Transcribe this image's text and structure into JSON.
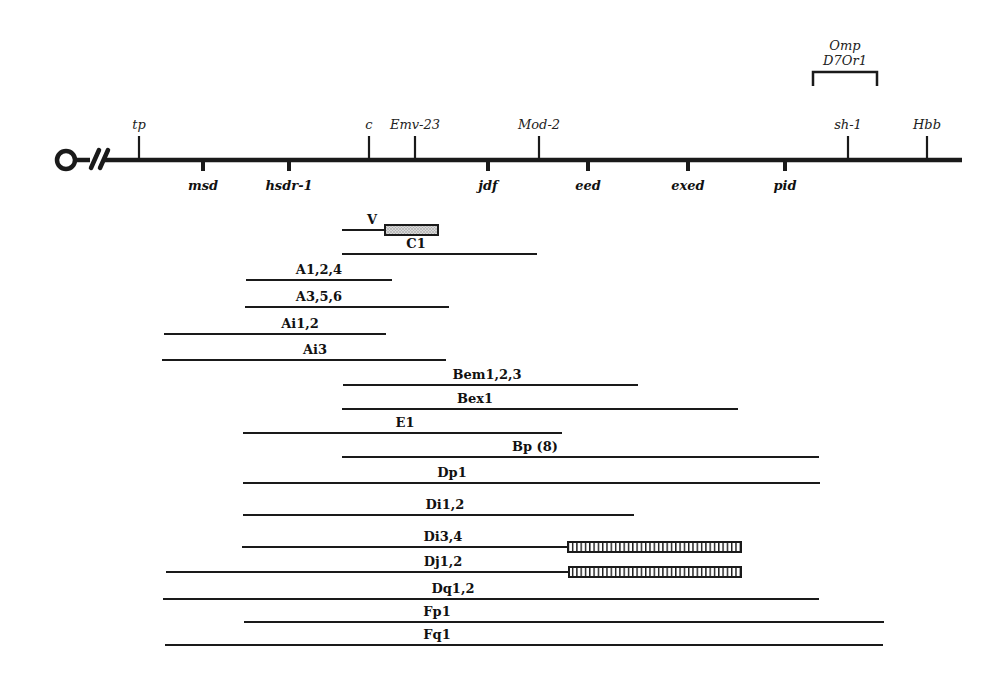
{
  "chromosome": {
    "centromere_symbol": "centromere-break",
    "axis": {
      "x_start": 105,
      "x_end": 962,
      "y": 160
    },
    "loci_above": [
      {
        "name": "tp",
        "x": 139
      },
      {
        "name": "c",
        "x": 369
      },
      {
        "name": "Emv-23",
        "x": 415
      },
      {
        "name": "Mod-2",
        "x": 539
      },
      {
        "name": "sh-1",
        "x": 848
      },
      {
        "name": "Hbb",
        "x": 927
      }
    ],
    "loci_below": [
      {
        "name": "msd",
        "x": 203
      },
      {
        "name": "hsdr-1",
        "x": 289
      },
      {
        "name": "jdf",
        "x": 488
      },
      {
        "name": "eed",
        "x": 588
      },
      {
        "name": "exed",
        "x": 688
      },
      {
        "name": "pid",
        "x": 785
      }
    ],
    "bracket": {
      "label_line1": "Omp",
      "label_line2": "D7Or1",
      "x_start": 813,
      "x_end": 877
    }
  },
  "deletions": [
    {
      "label": "V",
      "y": 230,
      "x_start": 342,
      "x_end": 385,
      "box": {
        "x_start": 385,
        "x_end": 438,
        "pattern": "stipple"
      },
      "label_x": 372
    },
    {
      "label": "C1",
      "y": 254,
      "x_start": 342,
      "x_end": 537,
      "label_x": 416
    },
    {
      "label": "A1,2,4",
      "y": 280,
      "x_start": 246,
      "x_end": 392,
      "label_x": 319
    },
    {
      "label": "A3,5,6",
      "y": 307,
      "x_start": 245,
      "x_end": 449,
      "label_x": 319
    },
    {
      "label": "Ai1,2",
      "y": 334,
      "x_start": 164,
      "x_end": 386,
      "label_x": 300
    },
    {
      "label": "Ai3",
      "y": 360,
      "x_start": 162,
      "x_end": 446,
      "label_x": 315
    },
    {
      "label": "Bem1,2,3",
      "y": 385,
      "x_start": 343,
      "x_end": 638,
      "label_x": 487
    },
    {
      "label": "Bex1",
      "y": 409,
      "x_start": 342,
      "x_end": 738,
      "label_x": 475
    },
    {
      "label": "E1",
      "y": 433,
      "x_start": 243,
      "x_end": 562,
      "label_x": 405
    },
    {
      "label": "Bp (8)",
      "y": 457,
      "x_start": 342,
      "x_end": 819,
      "label_x": 535
    },
    {
      "label": "Dp1",
      "y": 483,
      "x_start": 243,
      "x_end": 820,
      "label_x": 452
    },
    {
      "label": "Di1,2",
      "y": 515,
      "x_start": 243,
      "x_end": 634,
      "label_x": 445
    },
    {
      "label": "Di3,4",
      "y": 547,
      "x_start": 242,
      "x_end": 568,
      "box": {
        "x_start": 568,
        "x_end": 741,
        "pattern": "vertical-hatch"
      },
      "label_x": 443
    },
    {
      "label": "Dj1,2",
      "y": 572,
      "x_start": 166,
      "x_end": 569,
      "box": {
        "x_start": 569,
        "x_end": 741,
        "pattern": "vertical-hatch"
      },
      "label_x": 443
    },
    {
      "label": "Dq1,2",
      "y": 599,
      "x_start": 163,
      "x_end": 819,
      "label_x": 453
    },
    {
      "label": "Fp1",
      "y": 622,
      "x_start": 244,
      "x_end": 884,
      "label_x": 437
    },
    {
      "label": "Fq1",
      "y": 645,
      "x_start": 165,
      "x_end": 883,
      "label_x": 437
    }
  ],
  "colors": {
    "ink": "#1a1a1a",
    "background": "#ffffff",
    "stipple": "#bdbdbd"
  }
}
